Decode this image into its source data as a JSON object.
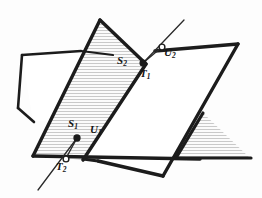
{
  "figure": {
    "type": "descriptive-geometry-diagram",
    "canvas": {
      "width": 262,
      "height": 198
    },
    "colors": {
      "background": "#fdfdfd",
      "outline": "#1c1c1c",
      "hatch": "#b9b9b9",
      "hatch_fill": "#fbfbfb",
      "label_text": "#141414",
      "marker_fill": "#ffffff"
    },
    "stroke_widths": {
      "plane_outline": 3.2,
      "thin_edge": 1.5,
      "intersection_line": 1.2,
      "hatch": 0.7
    }
  },
  "planes": [
    {
      "id": "plane-left",
      "name": "left-quadrilateral-plane",
      "hatched": false,
      "points": "22,55 76,47 110,122 33,120"
    },
    {
      "id": "plane-hatched",
      "name": "center-hatched-plane",
      "hatched": true,
      "points": "100,20 146,64 83,160 33,155"
    },
    {
      "id": "plane-right",
      "name": "right-quadrilateral-plane",
      "hatched": false,
      "points": "113,55 238,44 163,176 80,158"
    },
    {
      "id": "plane-right-hatch-triangle",
      "name": "right-lower-hatched-triangle",
      "hatched": true,
      "points": "203,113 250,158 176,158"
    }
  ],
  "edges": [
    {
      "id": "edge-left-top",
      "name": "left-plane-top-edge",
      "path": "M22,55 L81,51"
    },
    {
      "id": "edge-left-left",
      "name": "left-plane-left-edge",
      "path": "M22,55 L18,108"
    },
    {
      "id": "edge-left-bottom",
      "name": "left-plane-bottom-edge",
      "path": "M18,108 L33,121"
    },
    {
      "id": "edge-hatched-left",
      "name": "hatched-plane-left-edge",
      "path": "M100,20 L33,155"
    },
    {
      "id": "edge-hatched-right",
      "name": "hatched-plane-right-edge",
      "path": "M100,20 L146,64"
    },
    {
      "id": "edge-hatched-right-lower",
      "name": "hatched-plane-right-lower-edge",
      "path": "M146,64 L83,160"
    },
    {
      "id": "edge-hatched-bottom",
      "name": "hatched-plane-bottom-edge",
      "path": "M33,155 L200,158"
    },
    {
      "id": "edge-right-top",
      "name": "right-plane-top-edge",
      "path": "M155,51 L238,44"
    },
    {
      "id": "edge-right-right",
      "name": "right-plane-right-edge",
      "path": "M238,44 L163,176"
    },
    {
      "id": "edge-right-bottom",
      "name": "right-plane-bottom-edge",
      "path": "M163,176 L78,157"
    },
    {
      "id": "edge-right-triangle-apex",
      "name": "right-triangle-left-edge",
      "path": "M203,113 L176,158"
    },
    {
      "id": "edge-right-triangle-base",
      "name": "right-triangle-base-edge",
      "path": "M176,158 L250,158"
    }
  ],
  "intersection_lines": [
    {
      "id": "line-s-t",
      "name": "plane-intersection-line-upper",
      "path": "M60,135 L180,22",
      "description": "line through T2, S1, U1 region and T1, S2, U2"
    }
  ],
  "connector_segments": [
    {
      "id": "conn-t1-s2",
      "name": "t1-to-s2-segment",
      "path": "M143,63 L126,59"
    },
    {
      "id": "conn-u1-t2",
      "name": "u1-to-t2-segment",
      "path": "M77,138 L66,159"
    }
  ],
  "points": [
    {
      "id": "point-S2",
      "name": "point-marker-S2",
      "letter": "S",
      "subscript": "2",
      "label": "S₂",
      "x": 143,
      "y": 63,
      "marker": "filled",
      "label_x": 119,
      "label_y": 59
    },
    {
      "id": "point-T1",
      "name": "point-marker-T1",
      "letter": "T",
      "subscript": "1",
      "label": "T₁",
      "x": 143,
      "y": 63,
      "marker": "filled",
      "label_x": 141,
      "label_y": 71
    },
    {
      "id": "point-U2",
      "name": "point-marker-U2",
      "letter": "U",
      "subscript": "2",
      "label": "U₂",
      "x": 162,
      "y": 47,
      "marker": "hollow",
      "label_x": 164,
      "label_y": 52
    },
    {
      "id": "point-S1",
      "name": "point-marker-S1",
      "letter": "S",
      "subscript": "1",
      "label": "S₁",
      "x": 77,
      "y": 138,
      "marker": "filled",
      "label_x": 70,
      "label_y": 122
    },
    {
      "id": "point-U1",
      "name": "point-marker-U1",
      "letter": "U",
      "subscript": "1",
      "label": "U₁",
      "x": 77,
      "y": 138,
      "marker": "filled",
      "label_x": 90,
      "label_y": 127
    },
    {
      "id": "point-T2",
      "name": "point-marker-T2",
      "letter": "T",
      "subscript": "2",
      "label": "T₂",
      "x": 66,
      "y": 159,
      "marker": "hollow",
      "label_x": 58,
      "label_y": 163
    }
  ]
}
